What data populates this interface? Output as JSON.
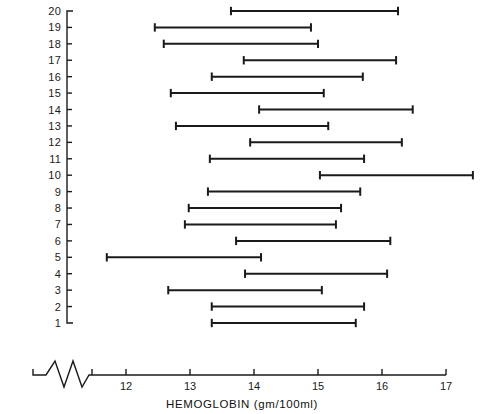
{
  "chart_data": {
    "type": "bar",
    "orientation": "horizontal",
    "style": "range-interval-plot",
    "title": "",
    "subtitle": "",
    "xlabel": "HEMOGLOBIN (gm/100ml)",
    "ylabel": "",
    "xtick_labels": [
      "12",
      "13",
      "14",
      "15",
      "16",
      "17"
    ],
    "xticks": [
      12,
      13,
      14,
      15,
      16,
      17
    ],
    "xlim": [
      11.45,
      17.0
    ],
    "axis_break": true,
    "axis_break_symbol": "zigzag",
    "grid": false,
    "legend": null,
    "ytick_labels": [
      "20",
      "19",
      "18",
      "17",
      "16",
      "15",
      "14",
      "13",
      "12",
      "11",
      "10",
      "9",
      "8",
      "7",
      "6",
      "5",
      "4",
      "3",
      "2",
      "1"
    ],
    "categories": [
      20,
      19,
      18,
      17,
      16,
      15,
      14,
      13,
      12,
      11,
      10,
      9,
      8,
      7,
      6,
      5,
      4,
      3,
      2,
      1
    ],
    "series": [
      {
        "name": "Hemoglobin range",
        "units": "gm/100ml",
        "intervals": [
          {
            "subject": 20,
            "low": 13.64,
            "high": 16.25
          },
          {
            "subject": 19,
            "low": 12.45,
            "high": 14.89
          },
          {
            "subject": 18,
            "low": 12.59,
            "high": 15.0
          },
          {
            "subject": 17,
            "low": 13.84,
            "high": 16.22
          },
          {
            "subject": 16,
            "low": 13.34,
            "high": 15.7
          },
          {
            "subject": 15,
            "low": 12.7,
            "high": 15.09
          },
          {
            "subject": 14,
            "low": 14.08,
            "high": 16.48
          },
          {
            "subject": 13,
            "low": 12.78,
            "high": 15.16
          },
          {
            "subject": 12,
            "low": 13.94,
            "high": 16.31
          },
          {
            "subject": 11,
            "low": 13.31,
            "high": 15.72
          },
          {
            "subject": 10,
            "low": 15.03,
            "high": 17.42
          },
          {
            "subject": 9,
            "low": 13.28,
            "high": 15.66
          },
          {
            "subject": 8,
            "low": 12.98,
            "high": 15.36
          },
          {
            "subject": 7,
            "low": 12.92,
            "high": 15.28
          },
          {
            "subject": 6,
            "low": 13.72,
            "high": 16.13
          },
          {
            "subject": 5,
            "low": 11.7,
            "high": 14.11
          },
          {
            "subject": 4,
            "low": 13.86,
            "high": 16.08
          },
          {
            "subject": 3,
            "low": 12.66,
            "high": 15.06
          },
          {
            "subject": 2,
            "low": 13.34,
            "high": 15.72
          },
          {
            "subject": 1,
            "low": 13.34,
            "high": 15.59
          }
        ]
      }
    ],
    "colors": {
      "line": "#1a1a1a",
      "axis": "#1a1a1a",
      "background": "#ffffff",
      "text": "#111111"
    }
  },
  "geometry": {
    "x_origin_px": 126,
    "x_unit_px": 64,
    "x_value_origin": 12,
    "y_top_px": 11,
    "y_step_px": 16.42,
    "y_top_value": 20,
    "y_axis_x_px": 67,
    "x_axis_y_px": 375,
    "axis_break_x0": 33,
    "axis_break_x1": 92
  }
}
